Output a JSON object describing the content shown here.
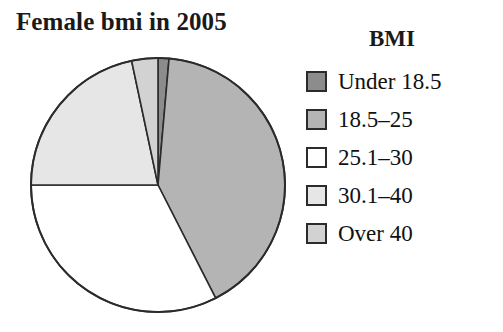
{
  "title": "Female bmi in 2005",
  "legend": {
    "heading": "BMI"
  },
  "colors": {
    "slice_under_18_5": "#8c8c8c",
    "slice_18_5_25": "#b4b4b4",
    "slice_25_1_30": "#ffffff",
    "slice_30_1_40": "#e6e6e6",
    "slice_over_40": "#d2d2d2",
    "outline": "#2b2b2b",
    "text": "#111111",
    "background": "#ffffff"
  },
  "chart_data": {
    "type": "pie",
    "title": "Female bmi in 2005",
    "legend_title": "BMI",
    "legend_position": "right",
    "start_angle_deg": 0,
    "direction": "clockwise",
    "categories": [
      "Under 18.5",
      "18.5–25",
      "25.1–30",
      "30.1–40",
      "Over 40"
    ],
    "values": [
      1.4,
      41.1,
      32.5,
      21.7,
      3.3
    ],
    "unit": "percent",
    "angles_deg": [
      5,
      148,
      117,
      78,
      12
    ],
    "colors": [
      "#8c8c8c",
      "#b4b4b4",
      "#ffffff",
      "#e6e6e6",
      "#d2d2d2"
    ],
    "xlabel": "",
    "ylabel": ""
  },
  "legend_items": [
    {
      "label": "Under 18.5",
      "color": "#8c8c8c"
    },
    {
      "label": "18.5–25",
      "color": "#b4b4b4"
    },
    {
      "label": "25.1–30",
      "color": "#ffffff"
    },
    {
      "label": "30.1–40",
      "color": "#e6e6e6"
    },
    {
      "label": "Over 40",
      "color": "#d2d2d2"
    }
  ]
}
